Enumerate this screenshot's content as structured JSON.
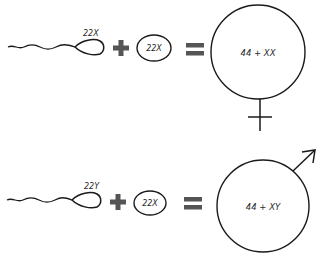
{
  "diagram": {
    "colors": {
      "stroke": "#1a1a1a",
      "operator": "#555555",
      "text": "#2a2a2a",
      "background": "#ffffff"
    },
    "rows": [
      {
        "id": "female",
        "sperm_label": "22X",
        "egg_label": "22X",
        "plus_operator": "+",
        "equals_operator": "=",
        "zygote_label": "44 + XX",
        "sex_symbol": "female-symbol"
      },
      {
        "id": "male",
        "sperm_label": "22Y",
        "egg_label": "22X",
        "plus_operator": "+",
        "equals_operator": "=",
        "zygote_label": "44 + XY",
        "sex_symbol": "male-symbol"
      }
    ]
  }
}
